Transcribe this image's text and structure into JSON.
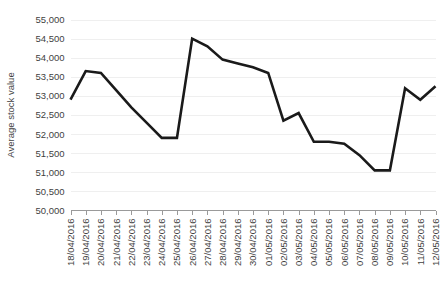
{
  "chart_data": {
    "type": "line",
    "title": "",
    "subtitle": "",
    "xlabel": "",
    "ylabel": "Average stock value",
    "ylim": [
      50000,
      55000
    ],
    "ytick_step": 500,
    "ytick_labels": [
      "50,000",
      "50,500",
      "51,000",
      "51,500",
      "52,000",
      "52,500",
      "53,000",
      "53,500",
      "54,000",
      "54,500",
      "55,000"
    ],
    "ytick_values": [
      50000,
      50500,
      51000,
      51500,
      52000,
      52500,
      53000,
      53500,
      54000,
      54500,
      55000
    ],
    "grid": true,
    "grid_axis": "y",
    "legend": false,
    "legend_position": "none",
    "line_color": "#1a1a1a",
    "grid_color": "#efefef",
    "axis_color": "#9a9a9a",
    "text_color": "#3f3f3f",
    "xtick_rotation": 90,
    "categories": [
      "18/04/2016",
      "19/04/2016",
      "20/04/2016",
      "21/04/2016",
      "22/04/2016",
      "23/04/2016",
      "24/04/2016",
      "25/04/2016",
      "26/04/2016",
      "27/04/2016",
      "28/04/2016",
      "29/04/2016",
      "30/04/2016",
      "01/05/2016",
      "02/05/2016",
      "03/05/2016",
      "04/05/2016",
      "05/05/2016",
      "06/05/2016",
      "07/05/2016",
      "08/05/2016",
      "09/05/2016",
      "10/05/2016",
      "11/05/2016",
      "12/05/2016"
    ],
    "values": [
      52900,
      53650,
      53600,
      53150,
      52700,
      52300,
      51900,
      51900,
      54500,
      54300,
      53950,
      53850,
      53750,
      53600,
      52350,
      52550,
      51800,
      51800,
      51750,
      51450,
      51050,
      51050,
      53200,
      52900,
      53250
    ]
  }
}
